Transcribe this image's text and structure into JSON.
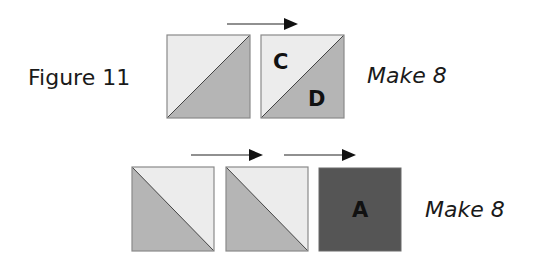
{
  "figure": {
    "title": "Figure 11",
    "rows": [
      {
        "caption": "Make 8",
        "units": [
          {
            "type": "half-square-triangle",
            "diagonal": "bottom-left-to-top-right",
            "light": "top-left",
            "dark": "bottom-right",
            "labels": []
          },
          {
            "type": "half-square-triangle",
            "diagonal": "bottom-left-to-top-right",
            "light": "top-left",
            "dark": "bottom-right",
            "labels": [
              "C",
              "D"
            ]
          }
        ],
        "arrows": 1
      },
      {
        "caption": "Make 8",
        "units": [
          {
            "type": "half-square-triangle",
            "diagonal": "top-left-to-bottom-right",
            "light": "top-right",
            "dark": "bottom-left",
            "labels": []
          },
          {
            "type": "half-square-triangle",
            "diagonal": "top-left-to-bottom-right",
            "light": "top-right",
            "dark": "bottom-left",
            "labels": []
          },
          {
            "type": "solid-square",
            "labels": [
              "A"
            ]
          }
        ],
        "arrows": 2
      }
    ],
    "letters": {
      "c": "C",
      "d": "D",
      "a": "A"
    },
    "colors": {
      "light": "#ececec",
      "medium": "#b5b5b5",
      "dark": "#555555",
      "outline": "#8a8a8a",
      "arrow": "#111111"
    }
  }
}
